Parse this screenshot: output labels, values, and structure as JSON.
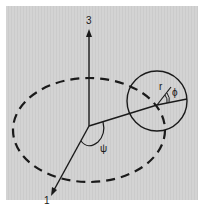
{
  "diagram": {
    "axis_labels": {
      "vertical": "3",
      "diagonal": "1"
    },
    "symbols": {
      "radius": "r",
      "small_angle": "ϕ",
      "azimuth_angle": "ψ"
    },
    "colors": {
      "background": "#d0d0d0",
      "stroke": "#1a1a1a"
    }
  }
}
